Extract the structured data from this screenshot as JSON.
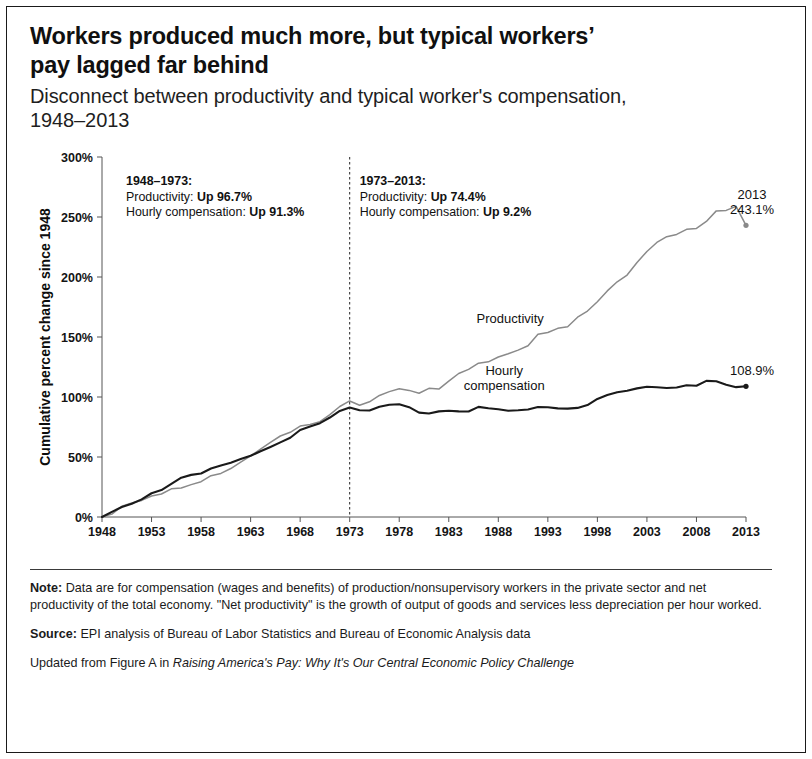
{
  "header": {
    "title": "Workers produced much more, but typical workers’ pay lagged far behind",
    "subtitle": "Disconnect between productivity and typical worker's compensation, 1948–2013"
  },
  "notes": {
    "note_label": "Note:",
    "note_text": " Data are for compensation (wages and benefits) of production/nonsupervisory workers in the private sector and net productivity of the total economy. \"Net productivity\" is the growth of output of goods and services less depreciation per hour worked.",
    "source_label": "Source:",
    "source_text": " EPI analysis of Bureau of Labor Statistics and Bureau of Economic Analysis data",
    "updated_prefix": "Updated from Figure A in ",
    "updated_italic": "Raising America's Pay: Why It's Our Central Economic Policy Challenge"
  },
  "chart_data": {
    "type": "line",
    "title": "Workers produced much more, but typical workers’ pay lagged far behind",
    "subtitle": "Disconnect between productivity and typical worker's compensation, 1948–2013",
    "xlabel": "",
    "ylabel": "Cumulative percent change since 1948",
    "xlim": [
      1948,
      2013
    ],
    "ylim": [
      0,
      300
    ],
    "yticks": [
      0,
      50,
      100,
      150,
      200,
      250,
      300
    ],
    "ytick_labels": [
      "0%",
      "50%",
      "100%",
      "150%",
      "200%",
      "250%",
      "300%"
    ],
    "xticks": [
      1948,
      1953,
      1958,
      1963,
      1968,
      1973,
      1978,
      1983,
      1988,
      1993,
      1998,
      2003,
      2008,
      2013
    ],
    "xtick_labels": [
      "1948",
      "1953",
      "1958",
      "1963",
      "1968",
      "1973",
      "1978",
      "1983",
      "1988",
      "1993",
      "1998",
      "2003",
      "2008",
      "2013"
    ],
    "grid": false,
    "legend_position": "inline-labels",
    "divider_year": 1973,
    "series": [
      {
        "name": "Productivity",
        "color": "#8a8a8a",
        "label_position": {
          "x": 1989.2,
          "y": 162
        },
        "end_label": {
          "line1": "2013",
          "line2": "243.1%"
        },
        "x": [
          1948,
          1949,
          1950,
          1951,
          1952,
          1953,
          1954,
          1955,
          1956,
          1957,
          1958,
          1959,
          1960,
          1961,
          1962,
          1963,
          1964,
          1965,
          1966,
          1967,
          1968,
          1969,
          1970,
          1971,
          1972,
          1973,
          1974,
          1975,
          1976,
          1977,
          1978,
          1979,
          1980,
          1981,
          1982,
          1983,
          1984,
          1985,
          1986,
          1987,
          1988,
          1989,
          1990,
          1991,
          1992,
          1993,
          1994,
          1995,
          1996,
          1997,
          1998,
          1999,
          2000,
          2001,
          2002,
          2003,
          2004,
          2005,
          2006,
          2007,
          2008,
          2009,
          2010,
          2011,
          2012,
          2013
        ],
        "y": [
          0,
          2.4,
          8.9,
          11.6,
          13.8,
          17.5,
          19.2,
          23.5,
          24.1,
          27.0,
          29.4,
          34.4,
          36.3,
          40.4,
          45.8,
          50.9,
          56.6,
          62.1,
          67.5,
          70.6,
          75.8,
          77.1,
          79.5,
          85.3,
          92.1,
          96.7,
          93.1,
          96.0,
          101.3,
          104.5,
          106.8,
          105.5,
          103.1,
          107.2,
          106.6,
          113.2,
          119.6,
          123.0,
          128.2,
          129.3,
          133.3,
          136.0,
          139.1,
          142.7,
          152.3,
          153.8,
          157.2,
          158.6,
          166.5,
          171.6,
          179.4,
          188.4,
          196.0,
          201.6,
          212.1,
          221.3,
          228.8,
          233.6,
          235.5,
          239.7,
          240.5,
          246.3,
          255.1,
          255.5,
          258.9,
          243.1
        ]
      },
      {
        "name": "Hourly compensation",
        "color": "#1a1a1a",
        "label_position": {
          "x": 1988.6,
          "y": 118
        },
        "end_label": {
          "line1": "",
          "line2": "108.9%"
        },
        "x": [
          1948,
          1949,
          1950,
          1951,
          1952,
          1953,
          1954,
          1955,
          1956,
          1957,
          1958,
          1959,
          1960,
          1961,
          1962,
          1963,
          1964,
          1965,
          1966,
          1967,
          1968,
          1969,
          1970,
          1971,
          1972,
          1973,
          1974,
          1975,
          1976,
          1977,
          1978,
          1979,
          1980,
          1981,
          1982,
          1983,
          1984,
          1985,
          1986,
          1987,
          1988,
          1989,
          1990,
          1991,
          1992,
          1993,
          1994,
          1995,
          1996,
          1997,
          1998,
          1999,
          2000,
          2001,
          2002,
          2003,
          2004,
          2005,
          2006,
          2007,
          2008,
          2009,
          2010,
          2011,
          2012,
          2013
        ],
        "y": [
          0,
          4.3,
          8.3,
          11.0,
          14.7,
          19.8,
          22.4,
          27.6,
          32.8,
          35.1,
          36.2,
          40.4,
          43.0,
          45.3,
          48.3,
          51.0,
          54.8,
          58.4,
          62.2,
          66.0,
          72.5,
          75.4,
          78.2,
          82.9,
          88.4,
          91.3,
          88.9,
          88.7,
          91.8,
          93.6,
          94.0,
          91.5,
          87.0,
          86.2,
          88.0,
          88.6,
          88.0,
          87.9,
          91.8,
          90.6,
          89.8,
          88.6,
          88.9,
          89.6,
          91.7,
          91.4,
          90.5,
          90.3,
          90.9,
          93.3,
          98.4,
          101.6,
          103.9,
          105.2,
          107.2,
          108.6,
          108.1,
          107.5,
          107.9,
          109.8,
          109.4,
          113.4,
          113.1,
          110.2,
          108.2,
          108.9
        ]
      }
    ],
    "annotations": [
      {
        "id": "period-1948-1973",
        "heading": "1948–1973:",
        "lines": [
          {
            "label": "Productivity: ",
            "value": "Up 96.7%"
          },
          {
            "label": "Hourly compensation: ",
            "value": "Up 91.3%"
          }
        ]
      },
      {
        "id": "period-1973-2013",
        "heading": "1973–2013:",
        "lines": [
          {
            "label": "Productivity: ",
            "value": "Up 74.4%"
          },
          {
            "label": "Hourly compensation: ",
            "value": "Up 9.2%"
          }
        ]
      }
    ]
  }
}
